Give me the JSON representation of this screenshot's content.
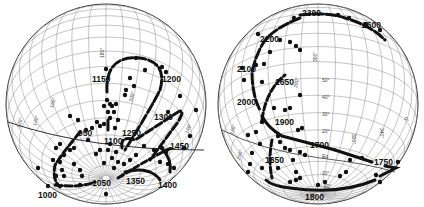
{
  "figure": {
    "left_globe": {
      "grid_labels": [
        "180°",
        "200°",
        "160°",
        "140°",
        "120°",
        "140°"
      ],
      "year_labels": [
        "1150",
        "1200",
        "950",
        "1100",
        "1250",
        "1300",
        "1450",
        "1000",
        "1050",
        "1350",
        "1400"
      ],
      "path_order": [
        "950",
        "1000",
        "1050",
        "1100",
        "1150",
        "1200",
        "1250",
        "1300",
        "1350",
        "1400",
        "1450"
      ]
    },
    "right_globe": {
      "grid_labels": [
        "300°",
        "280°",
        "50°",
        "40°",
        "30°",
        "20°",
        "Eq.",
        "-10°",
        "-20°",
        "240°",
        "260°",
        "320°",
        "340°",
        "0°"
      ],
      "year_labels": [
        "2300",
        "2600",
        "2200",
        "2100",
        "1650",
        "2000",
        "1900",
        "1700",
        "1850",
        "1750",
        "1800"
      ],
      "path_order": [
        "1650",
        "1700",
        "1750",
        "1800",
        "1850",
        "1900",
        "2000",
        "2100",
        "2200",
        "2300",
        "2600"
      ]
    },
    "colors": {
      "ink": "#111111",
      "grid": "#8a8a8a",
      "background": "#ffffff"
    }
  }
}
